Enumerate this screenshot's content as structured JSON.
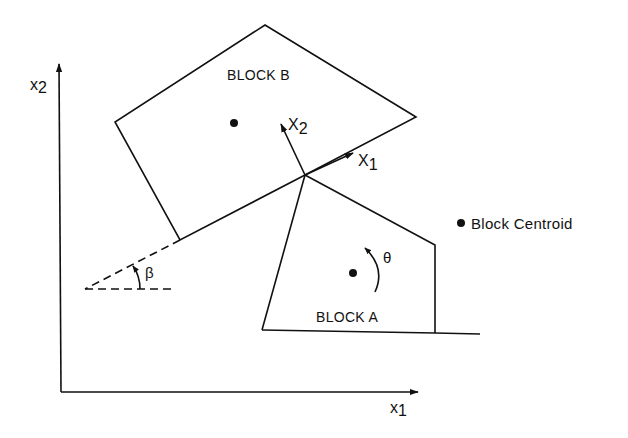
{
  "diagram": {
    "colors": {
      "ink": "#111111",
      "background": "#ffffff"
    },
    "global_axes": {
      "x_label": {
        "base": "x",
        "sub": "1"
      },
      "y_label": {
        "base": "x",
        "sub": "2"
      },
      "origin": [
        61,
        392
      ],
      "x_end": [
        418,
        392
      ],
      "y_end": [
        59,
        63
      ]
    },
    "block_b": {
      "label": "BLOCK B",
      "vertices": [
        [
          265,
          25
        ],
        [
          416,
          117
        ],
        [
          305,
          175
        ],
        [
          180,
          240
        ],
        [
          115,
          122
        ]
      ],
      "centroid": [
        234,
        123
      ]
    },
    "block_a": {
      "label": "BLOCK A",
      "vertices": [
        [
          305,
          175
        ],
        [
          435,
          245
        ],
        [
          435,
          333
        ],
        [
          262,
          330
        ]
      ],
      "centroid": [
        353,
        273
      ],
      "rotation_label": "θ"
    },
    "local_axes": {
      "origin": [
        305,
        175
      ],
      "x1": {
        "base": "X",
        "sub": "1",
        "tip": [
          352,
          154
        ]
      },
      "x2": {
        "base": "X",
        "sub": "2",
        "tip": [
          281,
          123
        ]
      }
    },
    "angle": {
      "label": "β",
      "vertex": [
        85,
        289
      ]
    },
    "ground_line": {
      "from": [
        435,
        333
      ],
      "to": [
        480,
        334
      ]
    },
    "legend": {
      "marker": "centroid-dot",
      "text": "Block Centroid"
    }
  }
}
